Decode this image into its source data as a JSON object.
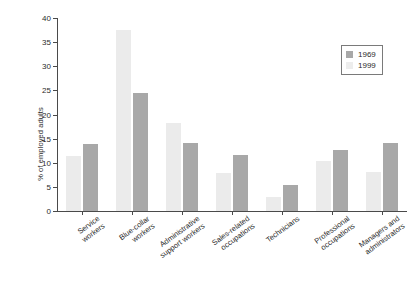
{
  "chart_data": {
    "type": "bar",
    "title": "",
    "xlabel": "",
    "ylabel": "% of employed adults",
    "ylim": [
      0,
      40
    ],
    "yticks": [
      0,
      5,
      10,
      15,
      20,
      25,
      30,
      35,
      40
    ],
    "grid": false,
    "legend_position": "top-right",
    "categories": [
      "Service\nworkers",
      "Blue-collar\nworkers",
      "Administrative\nsupport workers",
      "Sales-related\noccupations",
      "Technicians",
      "Professional\noccupations",
      "Managers and\nadministrators"
    ],
    "series": [
      {
        "name": "1969",
        "color": "#ebebeb",
        "values": [
          11.4,
          37.5,
          18.2,
          7.8,
          2.9,
          10.3,
          8.1
        ]
      },
      {
        "name": "1999",
        "color": "#a8a8a8",
        "values": [
          13.9,
          24.5,
          14.0,
          11.6,
          5.3,
          12.7,
          14.0
        ]
      }
    ]
  },
  "legend": {
    "entries": [
      {
        "label": "1969",
        "color": "#a8a8a8"
      },
      {
        "label": "1999",
        "color": "#ededed"
      }
    ]
  }
}
